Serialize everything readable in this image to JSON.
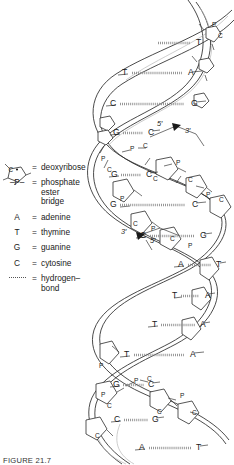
{
  "figure": {
    "caption": "FIGURE 21.7",
    "background_color": "#ffffff",
    "line_color": "#2b2b2b",
    "hbond_color": "#888888"
  },
  "legend": {
    "items": [
      {
        "symbol": "deoxyribose-ring",
        "symbol_text": "C",
        "equals": "=",
        "label": "deoxyribose",
        "label_cont": ""
      },
      {
        "symbol": "phosphate-bridge",
        "symbol_text": "–P–",
        "equals": "=",
        "label": "phosphate ester",
        "label_cont": "bridge"
      },
      {
        "symbol": "letter-A",
        "symbol_text": "A",
        "equals": "=",
        "label": "adenine",
        "label_cont": ""
      },
      {
        "symbol": "letter-T",
        "symbol_text": "T",
        "equals": "=",
        "label": "thymine",
        "label_cont": ""
      },
      {
        "symbol": "letter-G",
        "symbol_text": "G",
        "equals": "=",
        "label": "guanine",
        "label_cont": ""
      },
      {
        "symbol": "letter-C",
        "symbol_text": "C",
        "equals": "=",
        "label": "cytosine",
        "label_cont": ""
      },
      {
        "symbol": "dotted-line",
        "symbol_text": "",
        "equals": "=",
        "label": "hydrogen–",
        "label_cont": "bond"
      }
    ]
  },
  "helix": {
    "strand_direction_labels": [
      {
        "name": "five-prime-upper",
        "text": "5′"
      },
      {
        "name": "three-prime-upper",
        "text": "3′"
      },
      {
        "name": "three-prime-lower",
        "text": "3′"
      },
      {
        "name": "five-prime-lower",
        "text": "5′"
      }
    ],
    "base_pairs": [
      {
        "left": "",
        "right": "T",
        "y": 43,
        "lx": 150,
        "rx": 196,
        "bond_x": 158,
        "bond_w": 32
      },
      {
        "left": "T",
        "right": "A",
        "y": 73,
        "lx": 122,
        "rx": 188,
        "bond_x": 132,
        "bond_w": 50
      },
      {
        "left": "C",
        "right": "G",
        "y": 104,
        "lx": 110,
        "rx": 191,
        "bond_x": 120,
        "bond_w": 64
      },
      {
        "left": "G",
        "right": "C",
        "y": 133,
        "lx": 113,
        "rx": 148,
        "bond_x": 123,
        "bond_w": 20
      },
      {
        "left": "G",
        "right": "C",
        "y": 175,
        "lx": 111,
        "rx": 146,
        "bond_x": 121,
        "bond_w": 20
      },
      {
        "left": "G",
        "right": "C",
        "y": 205,
        "lx": 110,
        "rx": 192,
        "bond_x": 120,
        "bond_w": 65
      },
      {
        "left": "C",
        "right": "G",
        "y": 236,
        "lx": 140,
        "rx": 200,
        "bond_x": 150,
        "bond_w": 44
      },
      {
        "left": "A",
        "right": "T",
        "y": 265,
        "lx": 178,
        "rx": 216,
        "bond_x": 188,
        "bond_w": 23
      },
      {
        "left": "T",
        "right": "A",
        "y": 296,
        "lx": 172,
        "rx": 205,
        "bond_x": 181,
        "bond_w": 18
      },
      {
        "left": "T",
        "right": "A",
        "y": 325,
        "lx": 152,
        "rx": 200,
        "bond_x": 161,
        "bond_w": 34
      },
      {
        "left": "T",
        "right": "A",
        "y": 355,
        "lx": 124,
        "rx": 190,
        "bond_x": 134,
        "bond_w": 50
      },
      {
        "left": "G",
        "right": "C",
        "y": 385,
        "lx": 113,
        "rx": 148,
        "bond_x": 123,
        "bond_w": 21
      },
      {
        "left": "C",
        "right": "G",
        "y": 420,
        "lx": 114,
        "rx": 152,
        "bond_x": 124,
        "bond_w": 24
      },
      {
        "left": "A",
        "right": "T",
        "y": 448,
        "lx": 139,
        "rx": 196,
        "bond_x": 149,
        "bond_w": 42
      }
    ],
    "backbone_labels": [
      {
        "text": "P",
        "x": 212,
        "y": 22
      },
      {
        "text": "C",
        "x": 218,
        "y": 33
      },
      {
        "text": "P",
        "x": 130,
        "y": 146
      },
      {
        "text": "C",
        "x": 143,
        "y": 143
      },
      {
        "text": "C",
        "x": 153,
        "y": 176
      },
      {
        "text": "P",
        "x": 176,
        "y": 160
      },
      {
        "text": "C",
        "x": 188,
        "y": 177
      },
      {
        "text": "P",
        "x": 206,
        "y": 192
      },
      {
        "text": "C",
        "x": 219,
        "y": 197
      },
      {
        "text": "P",
        "x": 120,
        "y": 196
      },
      {
        "text": "C",
        "x": 133,
        "y": 221
      },
      {
        "text": "P",
        "x": 151,
        "y": 226
      },
      {
        "text": "C",
        "x": 170,
        "y": 236
      },
      {
        "text": "P",
        "x": 188,
        "y": 243
      },
      {
        "text": "P",
        "x": 101,
        "y": 156
      },
      {
        "text": "C",
        "x": 107,
        "y": 167
      },
      {
        "text": "P",
        "x": 101,
        "y": 392
      },
      {
        "text": "C",
        "x": 107,
        "y": 403
      },
      {
        "text": "P",
        "x": 134,
        "y": 378
      },
      {
        "text": "C",
        "x": 147,
        "y": 376
      },
      {
        "text": "C",
        "x": 157,
        "y": 409
      },
      {
        "text": "P",
        "x": 180,
        "y": 393
      },
      {
        "text": "C",
        "x": 192,
        "y": 410
      },
      {
        "text": "P",
        "x": 99,
        "y": 363
      },
      {
        "text": "C",
        "x": 95,
        "y": 433
      }
    ]
  }
}
